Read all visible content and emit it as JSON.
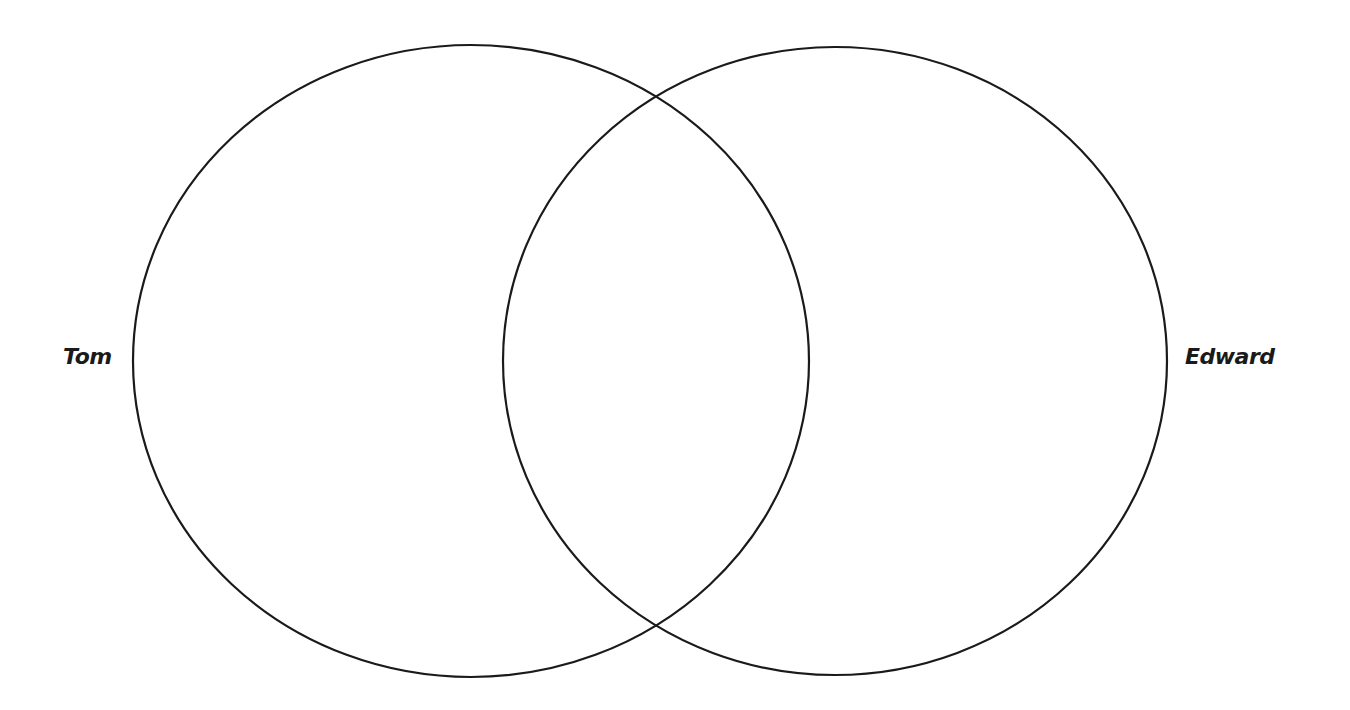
{
  "diagram": {
    "type": "venn",
    "sets": [
      {
        "name": "Tom",
        "label": "Tom"
      },
      {
        "name": "Edward",
        "label": "Edward"
      }
    ],
    "stroke_color": "#1a1a1a",
    "background_color": "#ffffff"
  }
}
